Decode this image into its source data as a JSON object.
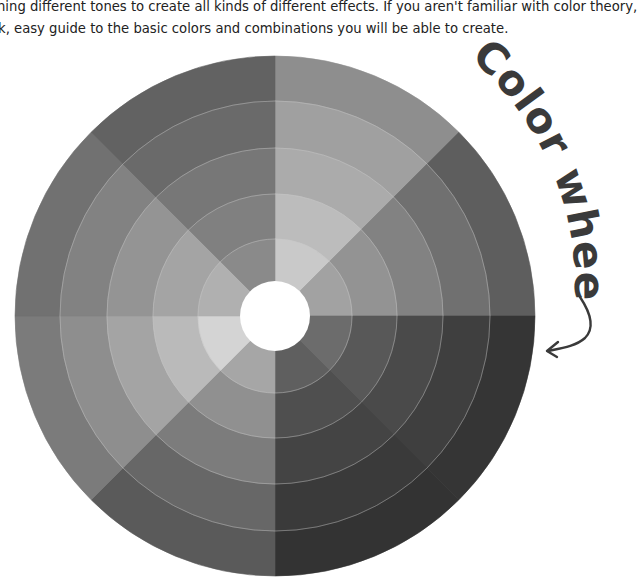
{
  "article": {
    "line1": "ning different tones to create all kinds of different effects. If you aren't familiar with color theory,",
    "line2": "k, easy guide to the basic colors and combinations you will be able to create."
  },
  "wheel": {
    "title": "Color wheel",
    "center": [
      275,
      316
    ],
    "radii": [
      260,
      215,
      168,
      122,
      77
    ],
    "hole_radius": 35,
    "ring_line_color": "#c8c8c8",
    "sectors_clockwise_from_top": [
      {
        "name": "sector-top-right",
        "shades": [
          "#8e8e8e",
          "#a0a0a0",
          "#ababab",
          "#bcbcbc",
          "#c9c9c9"
        ]
      },
      {
        "name": "sector-right-upper",
        "shades": [
          "#5e5e5e",
          "#707070",
          "#828282",
          "#939393",
          "#a2a2a2"
        ]
      },
      {
        "name": "sector-right-lower",
        "shades": [
          "#353535",
          "#3f3f3f",
          "#4a4a4a",
          "#585858",
          "#6c6c6c"
        ]
      },
      {
        "name": "sector-bottom-right",
        "shades": [
          "#333333",
          "#3a3a3a",
          "#444444",
          "#4f4f4f",
          "#5f5f5f"
        ]
      },
      {
        "name": "sector-bottom-left",
        "shades": [
          "#5a5a5a",
          "#676767",
          "#7c7c7c",
          "#909090",
          "#a6a6a6"
        ]
      },
      {
        "name": "sector-left-lower",
        "shades": [
          "#7b7b7b",
          "#8e8e8e",
          "#a4a4a4",
          "#bababa",
          "#d4d4d4"
        ]
      },
      {
        "name": "sector-left-upper",
        "shades": [
          "#717171",
          "#828282",
          "#949494",
          "#a4a4a4",
          "#b0b0b0"
        ]
      },
      {
        "name": "sector-top-left",
        "shades": [
          "#626262",
          "#6a6a6a",
          "#777777",
          "#808080",
          "#8a8a8a"
        ]
      }
    ]
  },
  "annotation": {
    "text_color": "#3a3a3a",
    "arrow_icon": "curved-arrow-icon"
  }
}
